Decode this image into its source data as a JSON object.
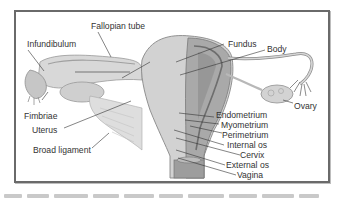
{
  "figure": {
    "labels": {
      "fallopian_tube": "Fallopian tube",
      "infundibulum": "Infundibulum",
      "fundus": "Fundus",
      "body": "Body",
      "fimbriae": "Fimbriae",
      "uterus": "Uterus",
      "ovary": "Ovary",
      "broad_ligament": "Broad ligament",
      "endometrium": "Endometrium",
      "myometrium": "Myometrium",
      "perimetrium": "Perimetrium",
      "internal_os": "Internal os",
      "cervix": "Cervix",
      "external_os": "External os",
      "vagina": "Vagina"
    },
    "colors": {
      "frame": "#6a6a6a",
      "tissue_light": "#d9d9d9",
      "tissue_mid": "#b5b5b5",
      "tissue_dark": "#8a8a8a",
      "leader_line": "#333333",
      "text": "#333333"
    }
  }
}
